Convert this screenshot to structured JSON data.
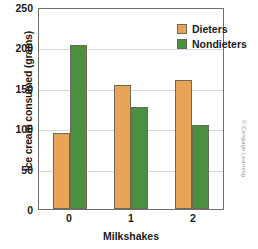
{
  "chart_data": {
    "type": "bar",
    "title": "",
    "xlabel": "Milkshakes",
    "ylabel": "Ice cream consumed (grams)",
    "categories": [
      "0",
      "1",
      "2"
    ],
    "series": [
      {
        "name": "Dieters",
        "color": "#e8a456",
        "values": [
          95,
          155,
          161
        ]
      },
      {
        "name": "Nondieters",
        "color": "#4b9040",
        "values": [
          205,
          128,
          105
        ]
      }
    ],
    "ylim": [
      0,
      250
    ],
    "yticks": [
      0,
      50,
      100,
      150,
      200,
      250
    ],
    "ytick_labels": [
      "0",
      "50",
      "100",
      "150",
      "200",
      "250"
    ],
    "grid": true,
    "legend_position": "top-right"
  },
  "legend": {
    "entries": [
      {
        "label": "Dieters"
      },
      {
        "label": "Nondieters"
      }
    ]
  },
  "credit": {
    "text": "© Cengage Learning"
  }
}
